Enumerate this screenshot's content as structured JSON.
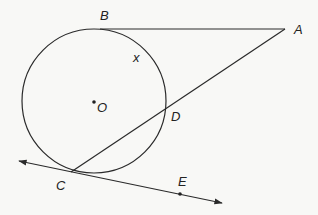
{
  "diagram": {
    "type": "geometry",
    "colors": {
      "background": "#f8f8f6",
      "stroke": "#2a2a2a",
      "text": "#222222"
    },
    "circle": {
      "center": "O",
      "cx": 94,
      "cy": 101,
      "r": 72
    },
    "points": {
      "A": {
        "label": "A",
        "x": 285,
        "y": 29
      },
      "B": {
        "label": "B",
        "x": 100,
        "y": 29
      },
      "C": {
        "label": "C",
        "x": 71,
        "y": 172
      },
      "D": {
        "label": "D",
        "x": 164,
        "y": 110
      },
      "E": {
        "label": "E",
        "x": 180,
        "y": 194
      },
      "O": {
        "label": "O",
        "x": 94,
        "y": 101
      }
    },
    "arc_label": "x",
    "segments": [
      {
        "name": "AB",
        "from": "A",
        "to": "B",
        "kind": "tangent-segment"
      },
      {
        "name": "AC",
        "from": "A",
        "to": "C",
        "kind": "secant"
      }
    ],
    "lines": [
      {
        "name": "CE",
        "through": [
          "C",
          "E"
        ],
        "kind": "tangent-line",
        "arrows": "both"
      }
    ]
  }
}
